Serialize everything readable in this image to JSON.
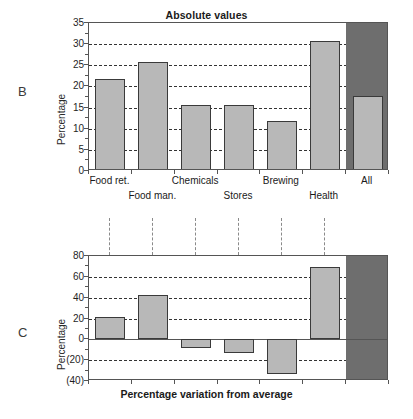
{
  "figure": {
    "panel_b_letter": "B",
    "panel_c_letter": "C"
  },
  "chart_data": [
    {
      "id": "panel-b",
      "type": "bar",
      "title": "Absolute values",
      "xlabel": "",
      "ylabel": "Percentage",
      "ylim": [
        0,
        35
      ],
      "yticks": [
        0,
        5,
        10,
        15,
        20,
        25,
        30,
        35
      ],
      "ytick_labels": [
        "0",
        "5",
        "10",
        "15",
        "20",
        "25",
        "30",
        "35"
      ],
      "grid": true,
      "legend": "none",
      "categories": [
        "Food ret.",
        "Food man.",
        "Chemicals",
        "Stores",
        "Brewing",
        "Health",
        "All"
      ],
      "values": [
        21.7,
        25.8,
        15.6,
        15.6,
        11.8,
        30.7,
        17.8
      ],
      "highlight_category": "All",
      "highlight_color": "#6e6e6e",
      "bar_color": "#b8b8b8",
      "bar_edge_color": "#3a3a3a"
    },
    {
      "id": "panel-c",
      "type": "bar",
      "title": "",
      "xlabel": "Percentage variation from average",
      "ylabel": "Percentage",
      "ylim": [
        -40,
        80
      ],
      "yticks": [
        -40,
        -20,
        0,
        20,
        40,
        60,
        80
      ],
      "ytick_labels": [
        "(40)",
        "(20)",
        "0",
        "20",
        "40",
        "60",
        "80"
      ],
      "grid": true,
      "legend": "none",
      "categories": [
        "Food ret.",
        "Food man.",
        "Chemicals",
        "Stores",
        "Brewing",
        "Health",
        "All"
      ],
      "values": [
        21,
        43,
        -8,
        -13,
        -33,
        69,
        0
      ],
      "highlight_category": "All",
      "highlight_color": "#6e6e6e",
      "bar_color": "#b8b8b8",
      "bar_edge_color": "#3a3a3a"
    }
  ]
}
